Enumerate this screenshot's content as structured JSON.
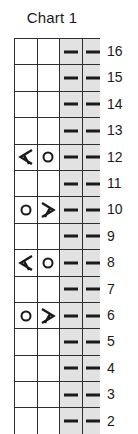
{
  "chart": {
    "title": "Chart 1",
    "columns": 4,
    "shaded_columns": [
      3,
      4
    ],
    "symbol_legend": {
      "purl": "purl-dash-symbol",
      "yo": "yarn-over-circle-symbol",
      "dec_left": "left-leaning-decrease-symbol",
      "dec_right": "right-leaning-decrease-symbol",
      "blank": "empty-cell"
    },
    "rows": [
      {
        "number": "16",
        "cells": [
          "blank",
          "blank",
          "purl",
          "purl"
        ]
      },
      {
        "number": "15",
        "cells": [
          "blank",
          "blank",
          "purl",
          "purl"
        ]
      },
      {
        "number": "14",
        "cells": [
          "blank",
          "blank",
          "purl",
          "purl"
        ]
      },
      {
        "number": "13",
        "cells": [
          "blank",
          "blank",
          "purl",
          "purl"
        ]
      },
      {
        "number": "12",
        "cells": [
          "dec_left",
          "yo",
          "purl",
          "purl"
        ]
      },
      {
        "number": "11",
        "cells": [
          "blank",
          "blank",
          "purl",
          "purl"
        ]
      },
      {
        "number": "10",
        "cells": [
          "yo",
          "dec_right",
          "purl",
          "purl"
        ]
      },
      {
        "number": "9",
        "cells": [
          "blank",
          "blank",
          "purl",
          "purl"
        ]
      },
      {
        "number": "8",
        "cells": [
          "dec_left",
          "yo",
          "purl",
          "purl"
        ]
      },
      {
        "number": "7",
        "cells": [
          "blank",
          "blank",
          "purl",
          "purl"
        ]
      },
      {
        "number": "6",
        "cells": [
          "yo",
          "dec_right",
          "purl",
          "purl"
        ]
      },
      {
        "number": "5",
        "cells": [
          "blank",
          "blank",
          "purl",
          "purl"
        ]
      },
      {
        "number": "4",
        "cells": [
          "blank",
          "blank",
          "purl",
          "purl"
        ]
      },
      {
        "number": "3",
        "cells": [
          "blank",
          "blank",
          "purl",
          "purl"
        ]
      },
      {
        "number": "2",
        "cells": [
          "blank",
          "blank",
          "purl",
          "purl"
        ]
      }
    ],
    "colors": {
      "grid_line": "#2e2e2e",
      "shaded_cell": "#e2e2e2",
      "plain_cell": "#ffffff",
      "symbol": "#1a1a1a",
      "text": "#1a1a1a",
      "background": "#ffffff"
    }
  }
}
